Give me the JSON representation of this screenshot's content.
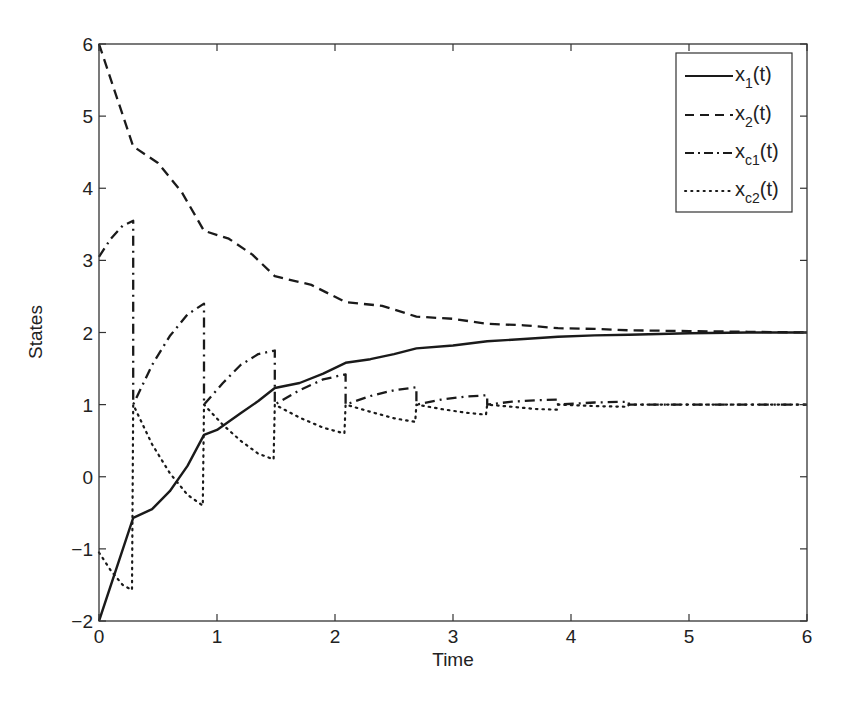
{
  "chart_data": {
    "type": "line",
    "title": "",
    "xlabel": "Time",
    "ylabel": "States",
    "xlim": [
      0,
      6
    ],
    "ylim": [
      -2,
      6
    ],
    "xticks": [
      0,
      1,
      2,
      3,
      4,
      5,
      6
    ],
    "yticks": [
      -2,
      -1,
      0,
      1,
      2,
      3,
      4,
      5,
      6
    ],
    "grid": false,
    "legend_position": "upper right",
    "series": [
      {
        "name": "x_1(t)",
        "label_base": "x",
        "label_sub": "1",
        "label_tail": "(t)",
        "style": "solid",
        "points": [
          [
            0,
            -2.0
          ],
          [
            0.29,
            -0.57
          ],
          [
            0.45,
            -0.45
          ],
          [
            0.6,
            -0.2
          ],
          [
            0.75,
            0.15
          ],
          [
            0.89,
            0.58
          ],
          [
            1.0,
            0.65
          ],
          [
            1.2,
            0.88
          ],
          [
            1.35,
            1.05
          ],
          [
            1.49,
            1.23
          ],
          [
            1.7,
            1.3
          ],
          [
            1.9,
            1.43
          ],
          [
            2.09,
            1.58
          ],
          [
            2.3,
            1.63
          ],
          [
            2.5,
            1.7
          ],
          [
            2.69,
            1.78
          ],
          [
            3.0,
            1.82
          ],
          [
            3.29,
            1.88
          ],
          [
            3.6,
            1.91
          ],
          [
            3.89,
            1.94
          ],
          [
            4.2,
            1.96
          ],
          [
            4.49,
            1.97
          ],
          [
            5.0,
            1.99
          ],
          [
            5.5,
            2.0
          ],
          [
            6.0,
            2.0
          ]
        ]
      },
      {
        "name": "x_2(t)",
        "label_base": "x",
        "label_sub": "2",
        "label_tail": "(t)",
        "style": "dashed",
        "points": [
          [
            0,
            6.0
          ],
          [
            0.29,
            4.58
          ],
          [
            0.5,
            4.35
          ],
          [
            0.7,
            3.95
          ],
          [
            0.89,
            3.41
          ],
          [
            1.1,
            3.3
          ],
          [
            1.3,
            3.08
          ],
          [
            1.49,
            2.78
          ],
          [
            1.8,
            2.66
          ],
          [
            2.09,
            2.42
          ],
          [
            2.4,
            2.37
          ],
          [
            2.69,
            2.22
          ],
          [
            3.0,
            2.19
          ],
          [
            3.29,
            2.12
          ],
          [
            3.6,
            2.1
          ],
          [
            3.89,
            2.06
          ],
          [
            4.2,
            2.05
          ],
          [
            4.49,
            2.03
          ],
          [
            5.0,
            2.02
          ],
          [
            5.5,
            2.01
          ],
          [
            6.0,
            2.0
          ]
        ]
      },
      {
        "name": "x_c1(t)",
        "label_base": "x",
        "label_sub": "c1",
        "label_tail": "(t)",
        "style": "dashdot",
        "points": [
          [
            0,
            3.05
          ],
          [
            0.1,
            3.3
          ],
          [
            0.2,
            3.48
          ],
          [
            0.29,
            3.55
          ],
          [
            0.29,
            1.0
          ],
          [
            0.45,
            1.55
          ],
          [
            0.6,
            1.95
          ],
          [
            0.75,
            2.25
          ],
          [
            0.89,
            2.4
          ],
          [
            0.89,
            1.0
          ],
          [
            1.05,
            1.3
          ],
          [
            1.2,
            1.55
          ],
          [
            1.35,
            1.7
          ],
          [
            1.49,
            1.75
          ],
          [
            1.49,
            1.0
          ],
          [
            1.7,
            1.2
          ],
          [
            1.9,
            1.35
          ],
          [
            2.09,
            1.42
          ],
          [
            2.09,
            1.0
          ],
          [
            2.3,
            1.12
          ],
          [
            2.5,
            1.2
          ],
          [
            2.69,
            1.24
          ],
          [
            2.69,
            1.0
          ],
          [
            2.9,
            1.07
          ],
          [
            3.1,
            1.11
          ],
          [
            3.29,
            1.13
          ],
          [
            3.29,
            1.0
          ],
          [
            3.5,
            1.04
          ],
          [
            3.7,
            1.06
          ],
          [
            3.89,
            1.07
          ],
          [
            3.89,
            1.0
          ],
          [
            4.2,
            1.03
          ],
          [
            4.49,
            1.04
          ],
          [
            4.49,
            1.0
          ],
          [
            6.0,
            1.0
          ]
        ]
      },
      {
        "name": "x_c2(t)",
        "label_base": "x",
        "label_sub": "c2",
        "label_tail": "(t)",
        "style": "dotted",
        "points": [
          [
            0,
            -1.05
          ],
          [
            0.1,
            -1.3
          ],
          [
            0.2,
            -1.5
          ],
          [
            0.28,
            -1.57
          ],
          [
            0.29,
            1.0
          ],
          [
            0.45,
            0.45
          ],
          [
            0.6,
            0.05
          ],
          [
            0.75,
            -0.25
          ],
          [
            0.88,
            -0.4
          ],
          [
            0.89,
            1.0
          ],
          [
            1.05,
            0.72
          ],
          [
            1.2,
            0.5
          ],
          [
            1.35,
            0.32
          ],
          [
            1.48,
            0.24
          ],
          [
            1.49,
            1.0
          ],
          [
            1.7,
            0.82
          ],
          [
            1.9,
            0.68
          ],
          [
            2.08,
            0.6
          ],
          [
            2.09,
            1.0
          ],
          [
            2.3,
            0.9
          ],
          [
            2.5,
            0.81
          ],
          [
            2.68,
            0.76
          ],
          [
            2.69,
            1.0
          ],
          [
            2.9,
            0.94
          ],
          [
            3.1,
            0.89
          ],
          [
            3.28,
            0.86
          ],
          [
            3.29,
            1.0
          ],
          [
            3.5,
            0.97
          ],
          [
            3.7,
            0.94
          ],
          [
            3.88,
            0.93
          ],
          [
            3.89,
            1.0
          ],
          [
            4.2,
            0.98
          ],
          [
            4.48,
            0.97
          ],
          [
            4.49,
            1.0
          ],
          [
            6.0,
            1.0
          ]
        ]
      }
    ]
  },
  "layout": {
    "plot": {
      "left": 99,
      "right": 807,
      "top": 44,
      "bottom": 621
    },
    "legend": {
      "left": 676,
      "top": 53,
      "width": 116,
      "height": 159
    }
  },
  "colors": {
    "axis": "#333333",
    "line": "#1a1a1a",
    "background": "#ffffff"
  }
}
